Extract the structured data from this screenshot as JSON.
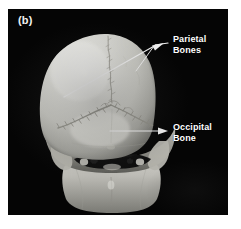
{
  "figure": {
    "panel_label": "(b)",
    "background_color": "#ffffff",
    "panel_color": "#050505",
    "bone_color": "#d8d8d4",
    "annotation_color": "#ffffff",
    "modality": "3D volume-rendered CT",
    "view": "posterior"
  },
  "annotations": [
    {
      "id": "parietal",
      "line1": "Parietal",
      "line2": "Bones",
      "full_text": "Parietal Bones",
      "arrow_tip_x": 158,
      "arrow_tip_y": 43,
      "leader_style": "forked"
    },
    {
      "id": "occipital",
      "line1": "Occipital",
      "line2": "Bone",
      "full_text": "Occipital Bone",
      "arrow_tip_x": 162,
      "arrow_tip_y": 130,
      "leader_style": "straight"
    }
  ],
  "anatomy": {
    "structures": [
      "cranial vault",
      "sagittal suture",
      "lambdoid suture",
      "occipital bone",
      "parietal bones",
      "mastoid process",
      "foramen magnum",
      "mandible"
    ]
  }
}
